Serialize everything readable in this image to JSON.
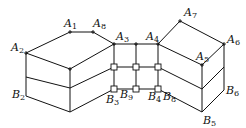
{
  "figure": {
    "labels": {
      "A1": {
        "letter": "A",
        "index": "1"
      },
      "A2": {
        "letter": "A",
        "index": "2"
      },
      "A3": {
        "letter": "A",
        "index": "3"
      },
      "A4": {
        "letter": "A",
        "index": "4"
      },
      "A5": {
        "letter": "A",
        "index": "5"
      },
      "A6": {
        "letter": "A",
        "index": "6"
      },
      "A7": {
        "letter": "A",
        "index": "7"
      },
      "A8": {
        "letter": "A",
        "index": "8"
      },
      "B2": {
        "letter": "B",
        "index": "2"
      },
      "B3": {
        "letter": "B",
        "index": "3"
      },
      "B4": {
        "letter": "B",
        "index": "4"
      },
      "B5": {
        "letter": "B",
        "index": "5"
      },
      "B6": {
        "letter": "B",
        "index": "6"
      },
      "B8": {
        "letter": "B",
        "index": "8"
      },
      "B9": {
        "letter": "B",
        "index": "9"
      }
    },
    "colors": {
      "line": "#111111",
      "background": "#ffffff"
    }
  }
}
